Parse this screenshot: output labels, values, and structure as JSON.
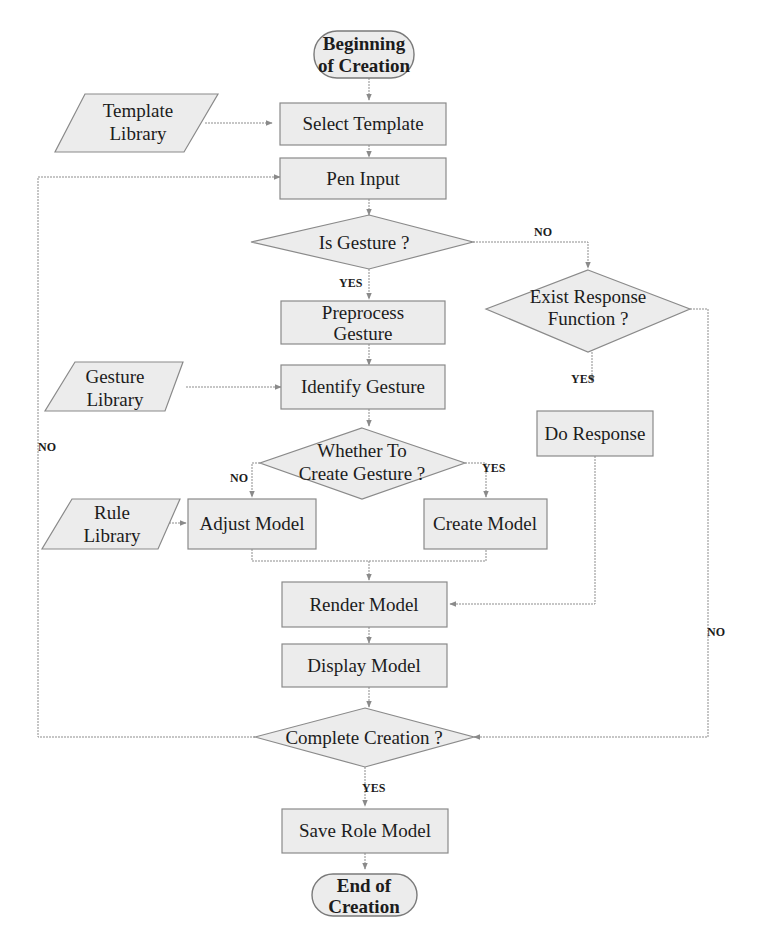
{
  "diagram": {
    "type": "flowchart",
    "nodes": {
      "start": {
        "line1": "Beginning",
        "line2": "of Creation"
      },
      "template_library": {
        "line1": "Template",
        "line2": "Library"
      },
      "select_template": {
        "label": "Select Template"
      },
      "pen_input": {
        "label": "Pen Input"
      },
      "is_gesture": {
        "label": "Is Gesture ?"
      },
      "preprocess_gesture": {
        "line1": "Preprocess",
        "line2": "Gesture"
      },
      "exist_response": {
        "line1": "Exist Response",
        "line2": "Function ?"
      },
      "gesture_library": {
        "line1": "Gesture",
        "line2": "Library"
      },
      "identify_gesture": {
        "label": "Identify Gesture"
      },
      "do_response": {
        "label": "Do Response"
      },
      "whether_create": {
        "line1": "Whether To",
        "line2": "Create Gesture ?"
      },
      "rule_library": {
        "line1": "Rule",
        "line2": "Library"
      },
      "adjust_model": {
        "label": "Adjust Model"
      },
      "create_model": {
        "label": "Create Model"
      },
      "render_model": {
        "label": "Render Model"
      },
      "display_model": {
        "label": "Display Model"
      },
      "complete_creation": {
        "label": "Complete Creation ?"
      },
      "save_role_model": {
        "label": "Save Role Model"
      },
      "end": {
        "line1": "End of",
        "line2": "Creation"
      }
    },
    "branch_labels": {
      "is_gesture_no": "NO",
      "is_gesture_yes": "YES",
      "exist_response_yes": "YES",
      "exist_response_no": "NO",
      "whether_create_no": "NO",
      "whether_create_yes": "YES",
      "complete_no": "NO",
      "complete_yes": "YES"
    },
    "edges": [
      [
        "start",
        "select_template"
      ],
      [
        "template_library",
        "select_template"
      ],
      [
        "select_template",
        "pen_input"
      ],
      [
        "pen_input",
        "is_gesture"
      ],
      [
        "is_gesture",
        "preprocess_gesture",
        "YES"
      ],
      [
        "is_gesture",
        "exist_response",
        "NO"
      ],
      [
        "preprocess_gesture",
        "identify_gesture"
      ],
      [
        "gesture_library",
        "identify_gesture"
      ],
      [
        "identify_gesture",
        "whether_create"
      ],
      [
        "whether_create",
        "adjust_model",
        "NO"
      ],
      [
        "whether_create",
        "create_model",
        "YES"
      ],
      [
        "rule_library",
        "adjust_model"
      ],
      [
        "adjust_model",
        "render_model"
      ],
      [
        "create_model",
        "render_model"
      ],
      [
        "exist_response",
        "do_response",
        "YES"
      ],
      [
        "exist_response",
        "complete_creation",
        "NO"
      ],
      [
        "do_response",
        "render_model"
      ],
      [
        "render_model",
        "display_model"
      ],
      [
        "display_model",
        "complete_creation"
      ],
      [
        "complete_creation",
        "save_role_model",
        "YES"
      ],
      [
        "complete_creation",
        "pen_input",
        "NO"
      ],
      [
        "save_role_model",
        "end"
      ]
    ]
  }
}
